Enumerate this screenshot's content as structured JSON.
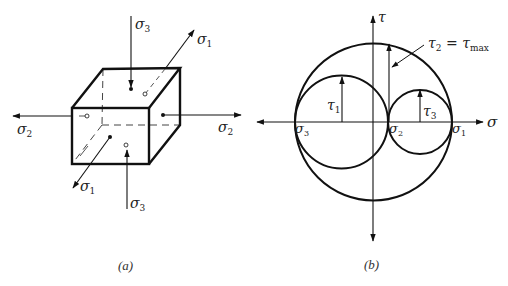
{
  "figure_a": {
    "caption": "(a)",
    "labels": {
      "sigma3_top": {
        "base": "σ",
        "sub": "3"
      },
      "sigma1_top": {
        "base": "σ",
        "sub": "1"
      },
      "sigma2_left": {
        "base": "σ",
        "sub": "2"
      },
      "sigma2_right": {
        "base": "σ",
        "sub": "2"
      },
      "sigma1_front": {
        "base": "σ",
        "sub": "1"
      },
      "sigma3_bottom": {
        "base": "σ",
        "sub": "3"
      }
    }
  },
  "figure_b": {
    "caption": "(b)",
    "axes": {
      "x_label": "σ",
      "y_label": "τ"
    },
    "points": {
      "sigma3": {
        "base": "σ",
        "sub": "3"
      },
      "sigma2": {
        "base": "σ",
        "sub": "2"
      },
      "sigma1": {
        "base": "σ",
        "sub": "1"
      }
    },
    "shear": {
      "tau1": {
        "base": "τ",
        "sub": "1"
      },
      "tau3": {
        "base": "τ",
        "sub": "3"
      },
      "tau2_eq": {
        "base": "τ",
        "sub": "2",
        "eq": " = ",
        "base2": "τ",
        "sub2": "max"
      }
    }
  },
  "colors": {
    "stroke": "#111111",
    "dashed": "#555555",
    "text": "#222222"
  }
}
